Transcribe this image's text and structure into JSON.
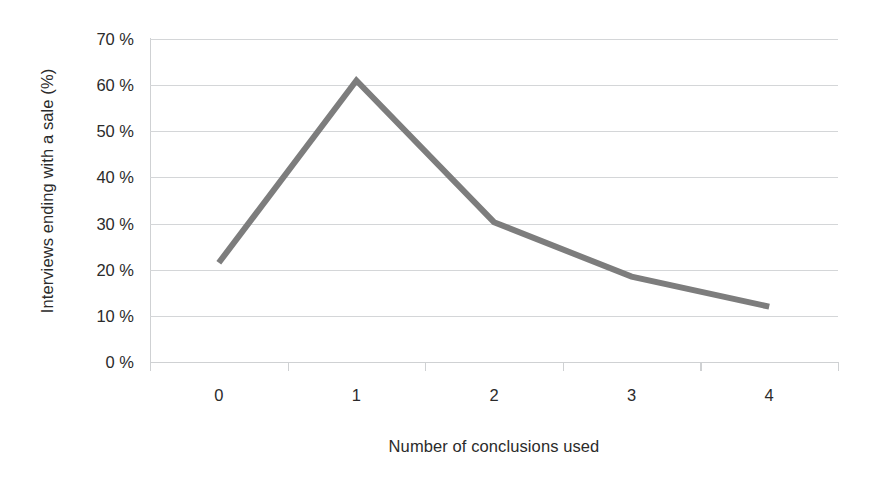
{
  "chart_data": {
    "type": "line",
    "title": "",
    "xlabel": "Number of conclusions used",
    "ylabel": "Interviews ending with a sale (%)",
    "categories": [
      "0",
      "1",
      "2",
      "3",
      "4"
    ],
    "x": [
      0,
      1,
      2,
      3,
      4
    ],
    "values": [
      21.5,
      61.0,
      30.3,
      18.5,
      12.0
    ],
    "series": [
      {
        "name": "Interviews ending with a sale",
        "values": [
          21.5,
          61.0,
          30.3,
          18.5,
          12.0
        ]
      }
    ],
    "ylim": [
      0,
      70
    ],
    "ytick_values": [
      0,
      10,
      20,
      30,
      40,
      50,
      60,
      70
    ],
    "ytick_labels": [
      "0 %",
      "10 %",
      "20 %",
      "30 %",
      "40 %",
      "50 %",
      "60 %",
      "70 %"
    ],
    "xtick_labels": [
      "0",
      "1",
      "2",
      "3",
      "4"
    ],
    "grid": "horizontal",
    "legend": "none",
    "line_color": "#7d7d7d",
    "gridline_color": "#d4d6d8",
    "axis_color": "#cfd1d3",
    "text_color": "#2b2b2b",
    "background_color": "#ffffff",
    "line_width": 6
  }
}
